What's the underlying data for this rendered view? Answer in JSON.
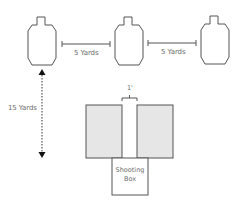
{
  "diagram": {
    "type": "shooting-drill-layout",
    "targets": [
      {
        "id": "target-left"
      },
      {
        "id": "target-center"
      },
      {
        "id": "target-right"
      }
    ],
    "spacing_labels": [
      "5 Yards",
      "5 Yards"
    ],
    "distance_label": "15 Yards",
    "gap_label": "1'",
    "shooting_box": {
      "line1": "Shooting",
      "line2": "Box"
    },
    "colors": {
      "outline": "#555555",
      "barrier_fill": "#e6e6e6",
      "text": "#6b6b6b"
    }
  }
}
